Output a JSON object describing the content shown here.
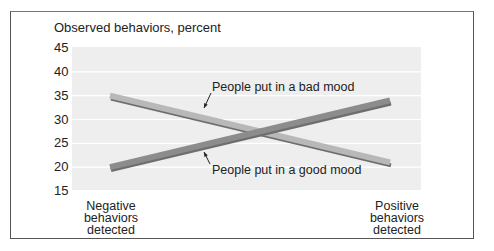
{
  "chart_data": {
    "type": "line",
    "title": "",
    "ylabel": "Observed behaviors, percent",
    "xlabel": "",
    "ylim": [
      15,
      45
    ],
    "yticks": [
      45,
      40,
      35,
      30,
      25,
      20,
      15
    ],
    "categories": [
      "Negative behaviors detected",
      "Positive behaviors detected"
    ],
    "category_lines": [
      [
        "Negative",
        "behaviors",
        "detected"
      ],
      [
        "Positive",
        "behaviors",
        "detected"
      ]
    ],
    "grid": true,
    "legend": "inline annotations with arrows",
    "series": [
      {
        "name": "People put in a bad mood",
        "values": [
          35,
          21
        ],
        "color": "#b8b8b8"
      },
      {
        "name": "People put in a good mood",
        "values": [
          20,
          34
        ],
        "color": "#8c8c8c"
      }
    ],
    "annotations": [
      {
        "text": "People put in a bad mood",
        "points_to": "People put in a bad mood"
      },
      {
        "text": "People put in a good mood",
        "points_to": "People put in a good mood"
      }
    ]
  }
}
